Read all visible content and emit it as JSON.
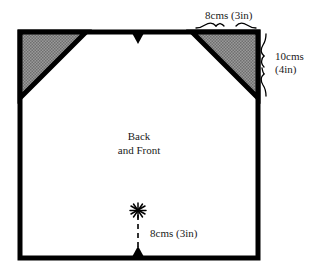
{
  "diagram": {
    "center_label_line1": "Back",
    "center_label_line2": "and Front",
    "center_label": "Back\nand Front",
    "colors": {
      "outline": "#000000",
      "shade_fill": "#8c8c8c",
      "background": "#ffffff",
      "text": "#1a1a1a"
    },
    "shape": {
      "name": "square-panel",
      "corner_cut": "shaded-triangle"
    }
  },
  "measurements": {
    "top": {
      "name": "corner-cut-width",
      "text": "8cms (3in)",
      "metric": "8cms",
      "imperial": "(3in)"
    },
    "right": {
      "name": "corner-cut-height",
      "text": "10cms (4in)",
      "metric": "10cms",
      "imperial": "(4in)"
    },
    "bottom": {
      "name": "notch-distance",
      "text": "8cms (3in)",
      "metric": "8cms",
      "imperial": "(3in)"
    }
  },
  "markers": {
    "top_notch": "notch-triangle-icon",
    "bottom_notch": "notch-triangle-icon",
    "star": "asterisk-star-icon",
    "dashed_guide": "dashed-guide-line",
    "brace_top": "curly-brace-horizontal-icon",
    "brace_right": "curly-brace-vertical-icon"
  }
}
